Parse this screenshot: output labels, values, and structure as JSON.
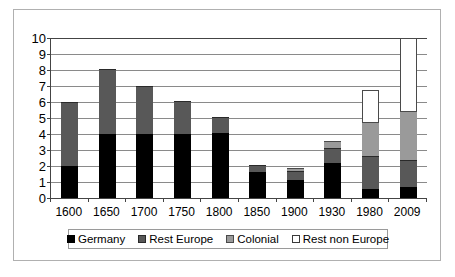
{
  "chart_data": {
    "type": "bar",
    "subtype": "stacked",
    "title": "",
    "xlabel": "",
    "ylabel": "",
    "ylim": [
      0,
      10
    ],
    "ytick_labels": [
      "10",
      "9",
      "8",
      "7",
      "6",
      "5",
      "4",
      "3",
      "2",
      "1",
      "0"
    ],
    "ytick_values": [
      10,
      9,
      8,
      7,
      6,
      5,
      4,
      3,
      2,
      1,
      0
    ],
    "grid": true,
    "legend_position": "bottom",
    "categories": [
      "1600",
      "1650",
      "1700",
      "1750",
      "1800",
      "1850",
      "1900",
      "1930",
      "1980",
      "2009"
    ],
    "series": [
      {
        "name": "Germany",
        "color": "#000000",
        "values": [
          2.0,
          4.0,
          4.0,
          4.0,
          4.05,
          1.6,
          1.1,
          2.2,
          0.55,
          0.7
        ]
      },
      {
        "name": "Rest Europe",
        "color": "#585858",
        "values": [
          4.0,
          4.05,
          3.0,
          2.05,
          1.0,
          0.45,
          0.6,
          0.95,
          2.05,
          1.65
        ]
      },
      {
        "name": "Colonial",
        "color": "#9a9a9a",
        "values": [
          0,
          0,
          0,
          0,
          0,
          0,
          0.15,
          0.4,
          2.15,
          3.1
        ]
      },
      {
        "name": "Rest non Europe",
        "color": "#ffffff",
        "values": [
          0,
          0,
          0,
          0,
          0,
          0,
          0,
          0,
          2.0,
          4.55
        ]
      }
    ],
    "totals": [
      6.0,
      8.05,
      7.0,
      6.05,
      5.05,
      2.05,
      1.85,
      3.55,
      6.75,
      10.0
    ]
  },
  "legend": {
    "items": [
      {
        "label": "Germany",
        "swatch": "germany-swatch"
      },
      {
        "label": "Rest Europe",
        "swatch": "rest-europe-swatch"
      },
      {
        "label": "Colonial",
        "swatch": "colonial-swatch"
      },
      {
        "label": "Rest non Europe",
        "swatch": "rest-non-europe-swatch"
      }
    ]
  }
}
